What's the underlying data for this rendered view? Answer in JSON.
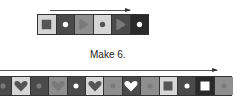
{
  "caption": "Make 6.",
  "colors": {
    "light": "#d6d6d6",
    "medium": "#8e8e8e",
    "dark": "#4a4a4a",
    "darker": "#2a2a2a",
    "symbol_dark": "#555555",
    "symbol_light": "#ffffff",
    "symbol_mid": "#7a7a7a"
  },
  "top_pattern": {
    "arrow": "right",
    "cells": [
      {
        "bg": "light",
        "shape": "square",
        "fill": "symbol_dark"
      },
      {
        "bg": "dark",
        "shape": "dot",
        "fill": "symbol_light"
      },
      {
        "bg": "medium",
        "shape": "triangle",
        "fill": "symbol_mid"
      },
      {
        "bg": "light",
        "shape": "dot",
        "fill": "symbol_dark"
      },
      {
        "bg": "dark",
        "shape": "triangle",
        "fill": "symbol_mid"
      },
      {
        "bg": "darker",
        "shape": "dot",
        "fill": "symbol_light"
      }
    ]
  },
  "bottom_pattern": {
    "arrow": "right",
    "cells": [
      {
        "bg": "dark",
        "shape": "dot",
        "fill": "symbol_mid"
      },
      {
        "bg": "light",
        "shape": "heart",
        "fill": "symbol_dark"
      },
      {
        "bg": "dark",
        "shape": "dot",
        "fill": "symbol_mid"
      },
      {
        "bg": "medium",
        "shape": "heart",
        "fill": "symbol_mid"
      },
      {
        "bg": "dark",
        "shape": "dot",
        "fill": "symbol_light"
      },
      {
        "bg": "light",
        "shape": "heart",
        "fill": "symbol_dark"
      },
      {
        "bg": "medium",
        "shape": "dot",
        "fill": "symbol_mid"
      },
      {
        "bg": "dark",
        "shape": "heart",
        "fill": "symbol_light"
      },
      {
        "bg": "medium",
        "shape": "dot",
        "fill": "symbol_mid"
      },
      {
        "bg": "light",
        "shape": "square",
        "fill": "symbol_dark"
      },
      {
        "bg": "dark",
        "shape": "dot",
        "fill": "symbol_light"
      },
      {
        "bg": "darker",
        "shape": "square",
        "fill": "symbol_light"
      },
      {
        "bg": "medium",
        "shape": "dot",
        "fill": "symbol_mid"
      }
    ]
  }
}
